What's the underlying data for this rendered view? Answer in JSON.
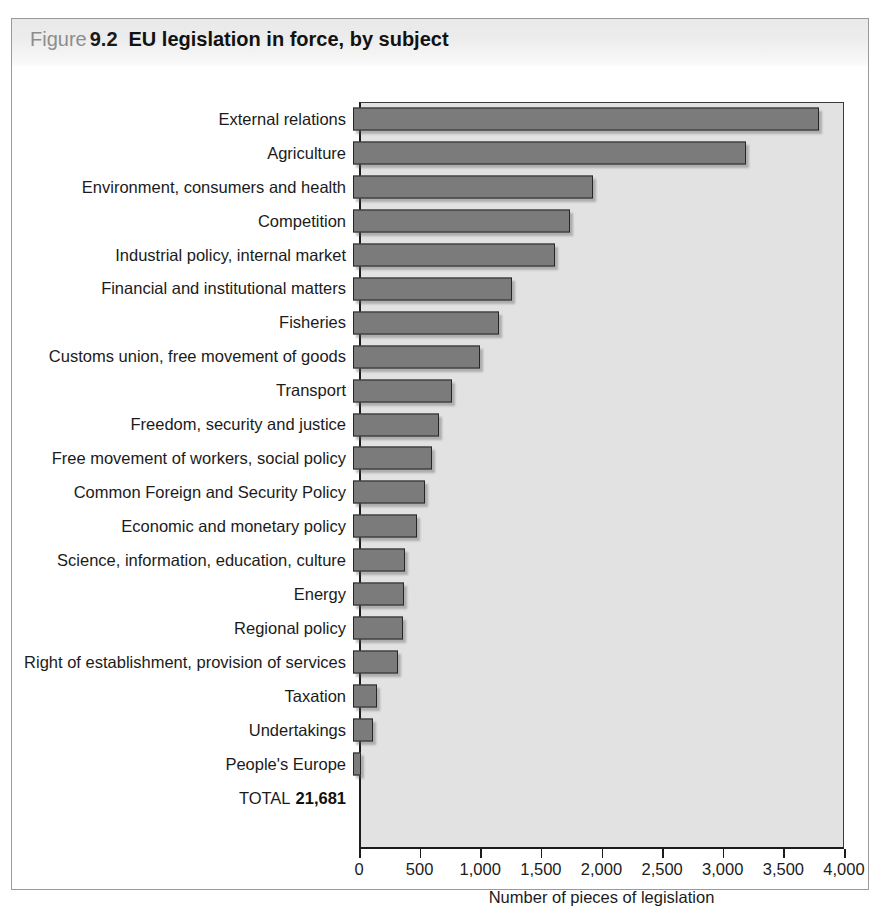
{
  "figure": {
    "label_word": "Figure",
    "number": "9.2",
    "title": "EU legislation in force, by subject"
  },
  "total": {
    "label": "TOTAL",
    "value": "21,681"
  },
  "colors": {
    "bar_fill": "#7b7b7b",
    "bar_border": "#262626",
    "plot_background": "#e2e2e2",
    "header_band": "#ececec",
    "frame_border": "#9a9a9a",
    "text": "#1b1b1b"
  },
  "chart_data": {
    "type": "bar",
    "orientation": "horizontal",
    "title": "EU legislation in force, by subject",
    "xlabel": "Number of pieces of legislation",
    "ylabel": "",
    "xlim": [
      0,
      4000
    ],
    "grid": false,
    "legend": false,
    "tick_labels": [
      "0",
      "500",
      "1,000",
      "1,500",
      "2,000",
      "2,500",
      "3,000",
      "3,500",
      "4,000"
    ],
    "ticks": [
      0,
      500,
      1000,
      1500,
      2000,
      2500,
      3000,
      3500,
      4000
    ],
    "categories": [
      "External relations",
      "Agriculture",
      "Environment, consumers and health",
      "Competition",
      "Industrial policy, internal market",
      "Financial and institutional matters",
      "Fisheries",
      "Customs union, free movement of goods",
      "Transport",
      "Freedom, security and justice",
      "Free movement of workers, social policy",
      "Common Foreign and Security Policy",
      "Economic and monetary policy",
      "Science, information, education, culture",
      "Energy",
      "Regional policy",
      "Right of establishment, provision of services",
      "Taxation",
      "Undertakings",
      "People's Europe"
    ],
    "values": [
      3840,
      3240,
      1980,
      1790,
      1670,
      1310,
      1200,
      1050,
      820,
      710,
      650,
      590,
      530,
      430,
      420,
      410,
      370,
      200,
      165,
      70
    ],
    "total": 21681
  }
}
